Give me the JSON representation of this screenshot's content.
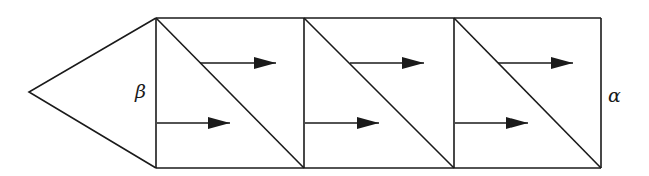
{
  "diagram": {
    "type": "geometric-flow-diagram",
    "stroke_color": "#1a1a1a",
    "background": "#ffffff",
    "labels": {
      "left": "β",
      "right": "α"
    },
    "cap": {
      "tip": [
        29,
        92
      ],
      "top": [
        156,
        18
      ],
      "bottom": [
        156,
        168
      ]
    },
    "frame": {
      "top": 18,
      "bottom": 168,
      "left": 156,
      "right": 601
    },
    "cells": [
      {
        "x0": 156,
        "x1": 304,
        "diagonal": [
          [
            156,
            18
          ],
          [
            304,
            168
          ]
        ],
        "arrows": [
          {
            "position": "upper",
            "y": 63,
            "x_start": 200,
            "x_end": 276
          },
          {
            "position": "lower",
            "y": 123,
            "x_start": 157,
            "x_end": 230
          }
        ]
      },
      {
        "x0": 304,
        "x1": 454,
        "diagonal": [
          [
            304,
            18
          ],
          [
            454,
            168
          ]
        ],
        "arrows": [
          {
            "position": "upper",
            "y": 63,
            "x_start": 350,
            "x_end": 424
          },
          {
            "position": "lower",
            "y": 123,
            "x_start": 305,
            "x_end": 379
          }
        ]
      },
      {
        "x0": 454,
        "x1": 601,
        "diagonal": [
          [
            454,
            18
          ],
          [
            601,
            168
          ]
        ],
        "arrows": [
          {
            "position": "upper",
            "y": 63,
            "x_start": 498,
            "x_end": 573
          },
          {
            "position": "lower",
            "y": 123,
            "x_start": 455,
            "x_end": 528
          }
        ]
      }
    ]
  }
}
